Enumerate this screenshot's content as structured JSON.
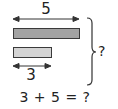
{
  "diagram": {
    "type": "bar-model",
    "top_label": "5",
    "bottom_label": "3",
    "total_label": "?",
    "equation": "3 + 5 = ?",
    "bars": [
      {
        "name": "long-bar",
        "length": 5,
        "color": "#a3a3a3"
      },
      {
        "name": "short-bar",
        "length": 3,
        "color": "#d4d4d4"
      }
    ],
    "colors": {
      "stroke": "#333333",
      "text": "#222222",
      "background": "#ffffff"
    }
  }
}
